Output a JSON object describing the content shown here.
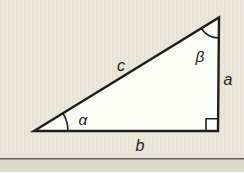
{
  "figure": {
    "type": "right-triangle-diagram",
    "labels": {
      "hypotenuse": "c",
      "vertical_side": "a",
      "base": "b",
      "angle_alpha": "α",
      "angle_beta": "β"
    },
    "colors": {
      "background": "#eae6da",
      "triangle_fill": "#fdfdf7",
      "line": "#1e1e1e",
      "rule_line": "#5f5b52",
      "bottom_strip": "#dcd8cb"
    }
  }
}
